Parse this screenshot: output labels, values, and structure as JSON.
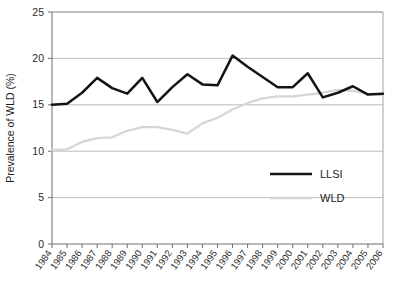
{
  "chart_data": {
    "type": "line",
    "title": "",
    "xlabel": "",
    "ylabel": "Prevalence of WLD (%)",
    "ylim": [
      0,
      25
    ],
    "yticks": [
      0,
      5,
      10,
      15,
      20,
      25
    ],
    "ytick_labels": [
      "0",
      "5",
      "10",
      "15",
      "20",
      "25"
    ],
    "grid": true,
    "legend_position": "center-right",
    "categories": [
      "1984",
      "1985",
      "1986",
      "1987",
      "1988",
      "1989",
      "1990",
      "1991",
      "1992",
      "1993",
      "1994",
      "1995",
      "1996",
      "1997",
      "1998",
      "1999",
      "2000",
      "2001",
      "2002",
      "2003",
      "2004",
      "2005",
      "2006"
    ],
    "series": [
      {
        "name": "LLSI",
        "color": "#141414",
        "values": [
          15.0,
          15.1,
          16.3,
          17.9,
          16.8,
          16.2,
          17.9,
          15.3,
          16.9,
          18.3,
          17.2,
          17.1,
          20.3,
          19.1,
          18.0,
          16.9,
          16.9,
          18.4,
          15.8,
          16.3,
          17.0,
          16.1,
          16.2
        ]
      },
      {
        "name": "WLD",
        "color": "#d6d6d6",
        "values": [
          10.1,
          10.2,
          11.0,
          11.4,
          11.5,
          12.2,
          12.6,
          12.6,
          12.3,
          11.9,
          13.0,
          13.6,
          14.5,
          15.2,
          15.7,
          15.9,
          15.9,
          16.1,
          16.3,
          16.6,
          16.5,
          16.2,
          16.1
        ]
      }
    ]
  },
  "legend": {
    "entries": [
      {
        "label": "LLSI",
        "color": "#141414"
      },
      {
        "label": "WLD",
        "color": "#d6d6d6"
      }
    ]
  },
  "axes": {
    "y_title": "Prevalence of WLD (%)"
  }
}
